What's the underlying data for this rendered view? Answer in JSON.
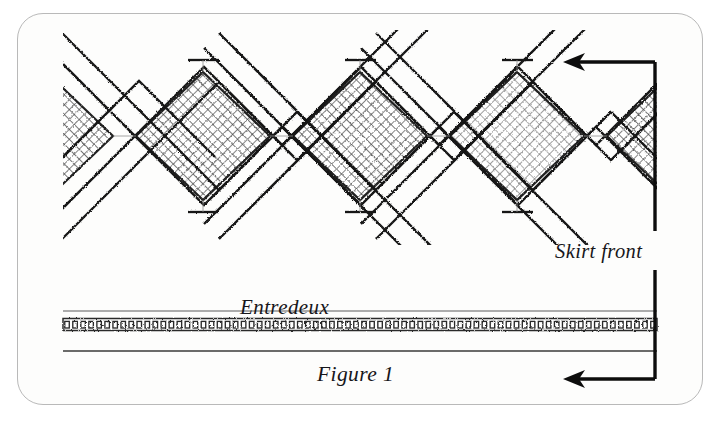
{
  "figure": {
    "caption": "Figure 1",
    "annotations": {
      "skirt_front": "Skirt front",
      "entredeux": "Entredeux"
    },
    "colors": {
      "ink": "#17161a",
      "card_background": "#fdfdfc",
      "card_border": "#b9b9b9",
      "page_background": "#ffffff",
      "lattice_stroke": "#1a1a1a",
      "mesh_fill": "#4a4a4a",
      "rule_line": "#3a3a3a"
    },
    "lattice": {
      "full_diamond_count": 3,
      "partial_diamond_count": 2,
      "band_style": "zigzag-stitched ribbon",
      "inner_fill": "cross-hatch mesh",
      "diamond_centers_x": [
        203,
        360,
        517
      ],
      "diamond_center_y": 136,
      "diamond_half_width": 79,
      "diamond_half_height": 78
    },
    "entredeux_band": {
      "style": "ladder of small rectangles",
      "left": 63,
      "right": 657,
      "top": 319,
      "height": 11,
      "cell_count": 74
    },
    "rules": [
      {
        "name": "upper-rule",
        "y": 311,
        "left": 63,
        "right": 657
      },
      {
        "name": "lower-rule",
        "y": 351,
        "left": 63,
        "right": 657
      }
    ],
    "bracket": {
      "vertical_x": 655,
      "top_arrow_y": 62,
      "bottom_arrow_y": 379,
      "arrow_tip_x": 563,
      "direction": "left"
    }
  }
}
